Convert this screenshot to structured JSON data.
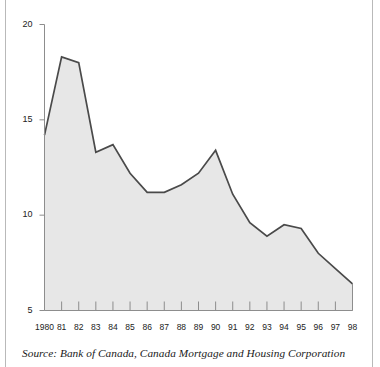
{
  "figure": {
    "source_note": "Source: Bank of Canada, Canada Mortgage and Housing Corporation"
  },
  "colors": {
    "line": "#4a4a4a",
    "fill": "#e7e7e7",
    "axis": "#8d8d8d",
    "text": "#222222",
    "edge_rule": "#b9b9b9"
  },
  "chart_data": {
    "type": "area",
    "title": "",
    "subtitle": "",
    "xlabel": "",
    "ylabel": "",
    "xlim": [
      1980,
      1998
    ],
    "ylim": [
      5,
      20
    ],
    "yticks": [
      5,
      10,
      15,
      20
    ],
    "ytick_labels": [
      "5",
      "10",
      "15",
      "20"
    ],
    "grid": false,
    "legend": null,
    "annotations": [],
    "baseline": 5,
    "x": [
      1980,
      1981,
      1982,
      1983,
      1984,
      1985,
      1986,
      1987,
      1988,
      1989,
      1990,
      1991,
      1992,
      1993,
      1994,
      1995,
      1996,
      1997,
      1998
    ],
    "xtick_labels": [
      "1980",
      "81",
      "82",
      "83",
      "84",
      "85",
      "86",
      "87",
      "88",
      "89",
      "90",
      "91",
      "92",
      "93",
      "94",
      "95",
      "96",
      "97",
      "98"
    ],
    "series": [
      {
        "name": "Mortgage rate",
        "values": [
          14.2,
          18.3,
          18.0,
          13.3,
          13.7,
          12.2,
          11.2,
          11.2,
          11.6,
          12.2,
          13.4,
          11.1,
          9.6,
          8.9,
          9.5,
          9.3,
          8.0,
          7.2,
          6.4
        ]
      }
    ]
  }
}
